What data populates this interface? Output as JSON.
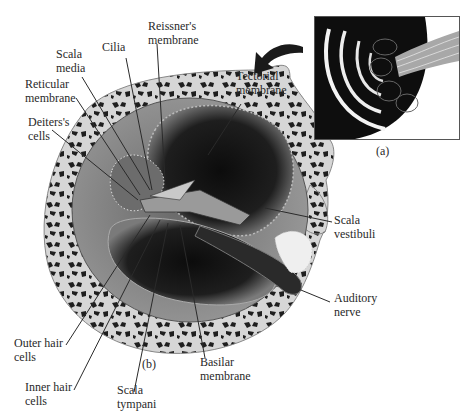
{
  "figure": {
    "panels": [
      {
        "id": "a",
        "caption": "(a)",
        "description": "Spiral cochlea with auditory nerve"
      },
      {
        "id": "b",
        "caption": "(b)",
        "description": "Cochlear duct cross-section"
      }
    ]
  },
  "labels": {
    "reissners_membrane": "Reissner's\nmembrane",
    "cilia": "Cilia",
    "scala_media": "Scala\nmedia",
    "reticular_membrane": "Reticular\nmembrane",
    "deiters_cells": "Deiters's\ncells",
    "tectorial_membrane": "Tectorial\nmembrane",
    "scala_vestibuli": "Scala\nvestibuli",
    "auditory_nerve": "Auditory\nnerve",
    "outer_hair_cells": "Outer hair\ncells",
    "inner_hair_cells": "Inner hair\ncells",
    "scala_tympani": "Scala\ntympani",
    "basilar_membrane": "Basilar\nmembrane"
  },
  "colors": {
    "bone": "#d8d8d8",
    "bone_spots": "#1e1e1e",
    "cavity": "#141414",
    "tissue": "#8a8a8a",
    "leader": "#2a2a2a"
  }
}
